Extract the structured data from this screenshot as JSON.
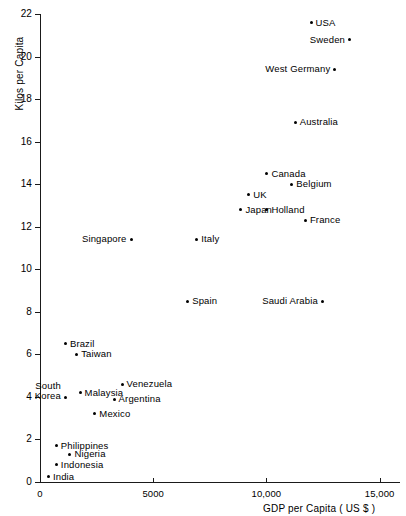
{
  "chart_data": {
    "type": "scatter",
    "title": "",
    "xlabel": "GDP per Capita  ( US $ )",
    "ylabel": "Kilos per Capita",
    "xlim": [
      0,
      15900
    ],
    "ylim": [
      0,
      22
    ],
    "xticks": [
      0,
      5000,
      10000,
      15000
    ],
    "xticklabels": [
      "0",
      "5000",
      "10,000",
      "15,000"
    ],
    "yticks": [
      0,
      2,
      4,
      6,
      8,
      10,
      12,
      14,
      16,
      18,
      20,
      22
    ],
    "yticklabels": [
      "0",
      "2",
      "4",
      "6",
      "8",
      "10",
      "12",
      "14",
      "16",
      "18",
      "20",
      "22"
    ],
    "grid": false,
    "legend": null,
    "points": [
      {
        "label": "USA",
        "x": 11950,
        "y": 21.6,
        "label_side": "right"
      },
      {
        "label": "Sweden",
        "x": 13650,
        "y": 20.8,
        "label_side": "left"
      },
      {
        "label": "West Germany",
        "x": 13000,
        "y": 19.4,
        "label_side": "left"
      },
      {
        "label": "Australia",
        "x": 11250,
        "y": 16.9,
        "label_side": "right"
      },
      {
        "label": "Canada",
        "x": 10000,
        "y": 14.5,
        "label_side": "right"
      },
      {
        "label": "Belgium",
        "x": 11100,
        "y": 14.0,
        "label_side": "right"
      },
      {
        "label": "UK",
        "x": 9200,
        "y": 13.5,
        "label_side": "right"
      },
      {
        "label": "Japan",
        "x": 8850,
        "y": 12.8,
        "label_side": "right"
      },
      {
        "label": "Holland",
        "x": 10000,
        "y": 12.8,
        "label_side": "right"
      },
      {
        "label": "France",
        "x": 11700,
        "y": 12.3,
        "label_side": "right"
      },
      {
        "label": "Italy",
        "x": 6900,
        "y": 11.4,
        "label_side": "right"
      },
      {
        "label": "Singapore",
        "x": 4000,
        "y": 11.4,
        "label_side": "left"
      },
      {
        "label": "Saudi Arabia",
        "x": 12450,
        "y": 8.5,
        "label_side": "left"
      },
      {
        "label": "Spain",
        "x": 6500,
        "y": 8.5,
        "label_side": "right"
      },
      {
        "label": "Brazil",
        "x": 1100,
        "y": 6.5,
        "label_side": "right"
      },
      {
        "label": "Taiwan",
        "x": 1600,
        "y": 6.0,
        "label_side": "right"
      },
      {
        "label": "Venezuela",
        "x": 3600,
        "y": 4.6,
        "label_side": "right"
      },
      {
        "label": "South Korea",
        "x": 1100,
        "y": 4.3,
        "label_side": "left"
      },
      {
        "label": "Malaysia",
        "x": 1750,
        "y": 4.2,
        "label_side": "right"
      },
      {
        "label": "Argentina",
        "x": 3250,
        "y": 3.9,
        "label_side": "right"
      },
      {
        "label": "Mexico",
        "x": 2400,
        "y": 3.2,
        "label_side": "right"
      },
      {
        "label": "Philippines",
        "x": 700,
        "y": 1.7,
        "label_side": "right"
      },
      {
        "label": "Nigeria",
        "x": 1300,
        "y": 1.3,
        "label_side": "right"
      },
      {
        "label": "Indonesia",
        "x": 700,
        "y": 0.8,
        "label_side": "right"
      },
      {
        "label": "India",
        "x": 350,
        "y": 0.25,
        "label_side": "right"
      }
    ]
  }
}
